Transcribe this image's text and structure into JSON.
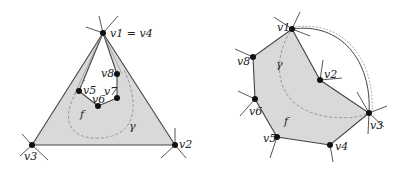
{
  "colors": {
    "face_fill": "#d9d9d9",
    "edge": "#444444",
    "vertex": "#111111",
    "curve": "#999999",
    "background": "#ffffff"
  },
  "left_diagram": {
    "vertices": [
      {
        "id": "v1",
        "label": "v1 = v4",
        "x": 103,
        "y": 33
      },
      {
        "id": "v2",
        "label": "v2",
        "x": 175,
        "y": 145
      },
      {
        "id": "v3",
        "label": "v3",
        "x": 32,
        "y": 145
      },
      {
        "id": "v5",
        "label": "v5",
        "x": 79,
        "y": 91
      },
      {
        "id": "v6",
        "label": "v6",
        "x": 98,
        "y": 106
      },
      {
        "id": "v7",
        "label": "v7",
        "x": 117,
        "y": 98
      },
      {
        "id": "v8",
        "label": "v8",
        "x": 117,
        "y": 74
      }
    ],
    "face_label": "f",
    "curve_label": "γ"
  },
  "right_diagram": {
    "vertices": [
      {
        "id": "v1",
        "label": "v1",
        "x": 292,
        "y": 29
      },
      {
        "id": "v2",
        "label": "v2",
        "x": 320,
        "y": 80
      },
      {
        "id": "v3",
        "label": "v3",
        "x": 369,
        "y": 113
      },
      {
        "id": "v4",
        "label": "v4",
        "x": 330,
        "y": 145
      },
      {
        "id": "v5",
        "label": "v5",
        "x": 277,
        "y": 137
      },
      {
        "id": "v6",
        "label": "v6",
        "x": 255,
        "y": 99
      },
      {
        "id": "v8",
        "label": "v8",
        "x": 253,
        "y": 57
      }
    ],
    "face_label": "f",
    "curve_label": "γ"
  }
}
